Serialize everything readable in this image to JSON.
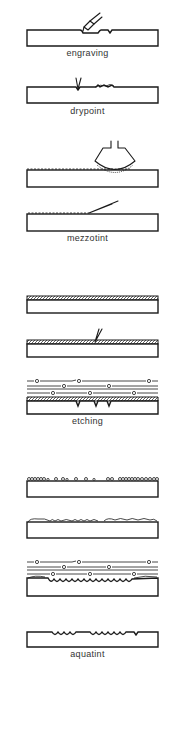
{
  "diagram": {
    "title": "",
    "colors": {
      "line": "#1a1a1a",
      "label": "#333333",
      "background": "#ffffff"
    },
    "techniques": [
      {
        "id": "engraving",
        "label": "engraving",
        "steps": [
          "burin cutting groove into plate"
        ]
      },
      {
        "id": "drypoint",
        "label": "drypoint",
        "steps": [
          "needle scratching plate, raising burr"
        ]
      },
      {
        "id": "mezzotint",
        "label": "mezzotint",
        "steps": [
          "rocker roughening plate surface",
          "scraper smoothing roughened surface"
        ]
      },
      {
        "id": "etching",
        "label": "etching",
        "steps": [
          "plate coated with ground",
          "needle drawing through ground",
          "plate in acid bath, lines bitten"
        ]
      },
      {
        "id": "aquatint",
        "label": "aquatint",
        "steps": [
          "resin particles dusted on plate",
          "resin fused to plate",
          "plate in acid bath, bitten around particles",
          "finished plate with pitted texture"
        ]
      }
    ]
  }
}
